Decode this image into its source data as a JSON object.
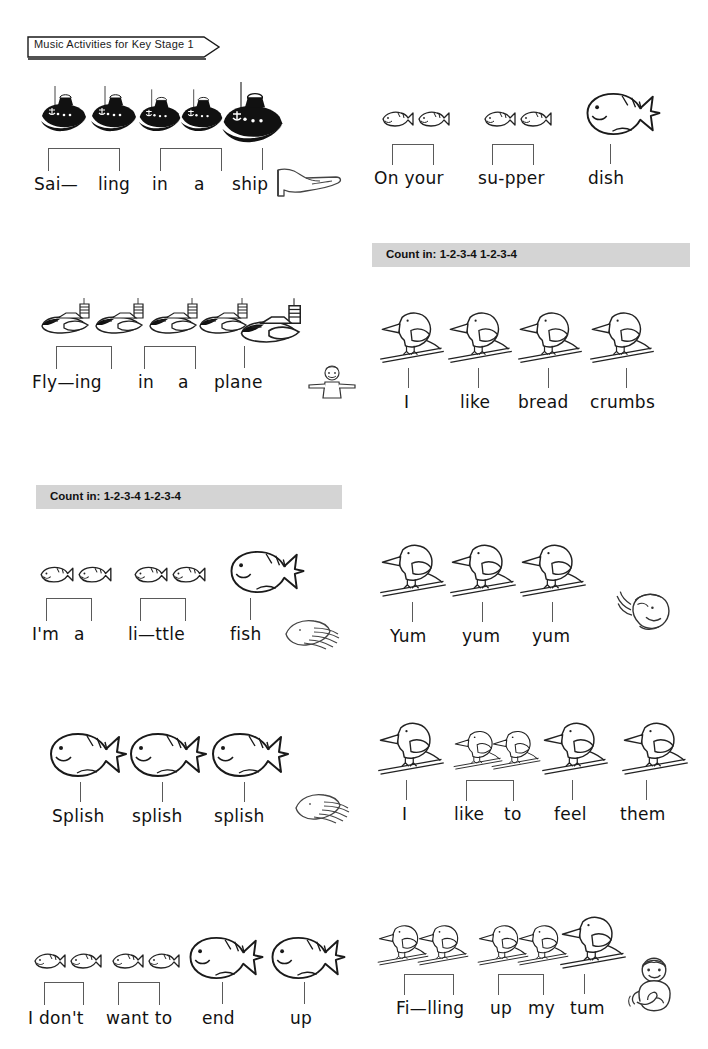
{
  "page": {
    "title": "Music Activities for Key Stage 1",
    "background": "#ffffff",
    "ink": "#111111",
    "countbar_color": "#d4d4d4",
    "stem_color": "#5a5a5a",
    "width": 708,
    "height": 1049
  },
  "count_in": {
    "label": "Count in:",
    "pattern_1": "1-2-3-4",
    "pattern_2": "1-2-3-4",
    "full_text": "Count in: 1-2-3-4 1-2-3-4"
  },
  "stanzas": [
    {
      "id": "sailing-in-a-ship",
      "icon_name": "pointing-hand-icon",
      "pictures": "ship",
      "picture_count": 5,
      "words": [
        "Sai—",
        "ling",
        "in",
        "a",
        "ship"
      ]
    },
    {
      "id": "on-your-supper-dish",
      "icon_name": "none",
      "pictures": "fish",
      "picture_count": 5,
      "words": [
        "On your",
        "su-pper",
        "dish"
      ]
    },
    {
      "id": "flying-in-a-plane",
      "icon_name": "arms-out-person-icon",
      "pictures": "plane",
      "picture_count": 5,
      "words": [
        "Fly—ing",
        "in",
        "a",
        "plane"
      ]
    },
    {
      "id": "i-like-bread-crumbs",
      "icon_name": "none",
      "pictures": "bird",
      "picture_count": 4,
      "words": [
        "I",
        "like",
        "bread",
        "crumbs"
      ]
    },
    {
      "id": "im-a-little-fish",
      "icon_name": "clapping-hands-icon",
      "pictures": "fish",
      "picture_count": 5,
      "words": [
        "I'm",
        "a",
        "li—ttle",
        "fish"
      ]
    },
    {
      "id": "yum-yum-yum",
      "icon_name": "singing-head-icon",
      "pictures": "bird",
      "picture_count": 3,
      "words": [
        "Yum",
        "yum",
        "yum"
      ]
    },
    {
      "id": "splish-splish-splish",
      "icon_name": "clapping-hands-icon",
      "pictures": "big-fish",
      "picture_count": 3,
      "words": [
        "Splish",
        "splish",
        "splish"
      ]
    },
    {
      "id": "i-like-to-feel-them",
      "icon_name": "none",
      "pictures": "bird",
      "picture_count": 5,
      "words": [
        "I",
        "like",
        "to",
        "feel",
        "them"
      ]
    },
    {
      "id": "i-dont-want-to-end-up",
      "icon_name": "none",
      "pictures": "fish",
      "picture_count": 6,
      "words": [
        "I don't",
        "want to",
        "end",
        "up"
      ]
    },
    {
      "id": "filling-up-my-tum",
      "icon_name": "patting-tummy-person-icon",
      "pictures": "bird",
      "picture_count": 5,
      "words": [
        "Fi—lling",
        "up",
        "my",
        "tum"
      ]
    }
  ],
  "text": {
    "w_sai": "Sai—",
    "w_ling": "ling",
    "w_in": "in",
    "w_a": "a",
    "w_ship": "ship",
    "w_onyour": "On your",
    "w_supper": "su-pper",
    "w_dish": "dish",
    "w_flying": "Fly—ing",
    "w_in2": "in",
    "w_a2": "a",
    "w_plane": "plane",
    "w_i": "I",
    "w_like": "like",
    "w_bread": "bread",
    "w_crumbs": "crumbs",
    "w_ima": "I'm",
    "w_a3": "a",
    "w_little": "li—ttle",
    "w_fish": "fish",
    "w_Yum": "Yum",
    "w_yum2": "yum",
    "w_yum3": "yum",
    "w_Splish": "Splish",
    "w_splish2": "splish",
    "w_splish3": "splish",
    "w_i2": "I",
    "w_like2": "like",
    "w_to": "to",
    "w_feel": "feel",
    "w_them": "them",
    "w_idont": "I don't",
    "w_wantto": "want to",
    "w_end": "end",
    "w_up": "up",
    "w_filling": "Fi—lling",
    "w_up2": "up",
    "w_my": "my",
    "w_tum": "tum"
  }
}
